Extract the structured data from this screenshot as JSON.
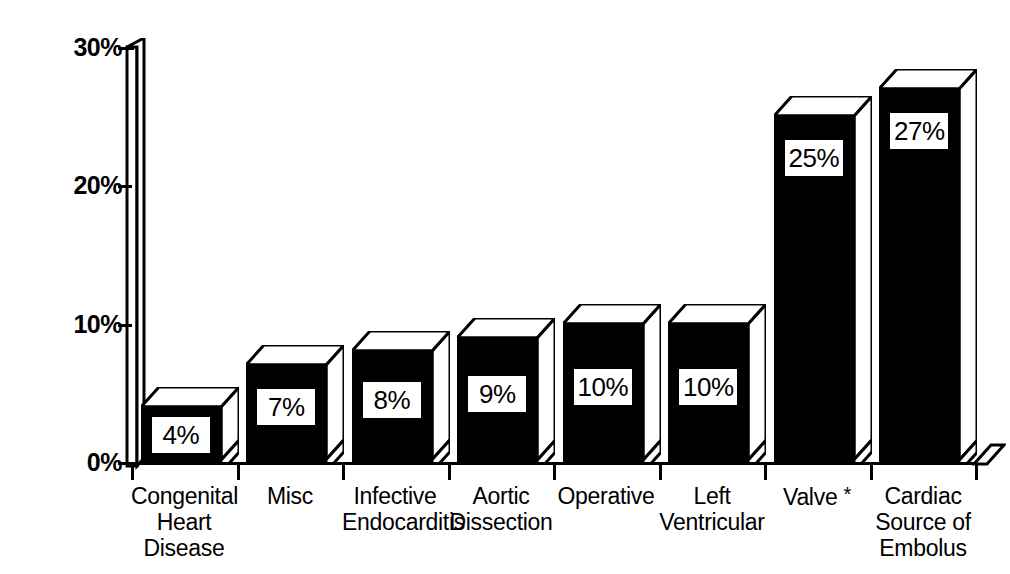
{
  "chart_data": {
    "type": "bar",
    "title": "",
    "subtitle": "",
    "xlabel": "",
    "ylabel": "",
    "categories": [
      "Congenital Heart Disease",
      "Misc",
      "Infective Endocarditis",
      "Aortic Dissection",
      "Operative",
      "Left Ventricular",
      "Valve *",
      "Cardiac Source of Embolus"
    ],
    "category_lines": [
      [
        "Congenital",
        "Heart",
        "Disease"
      ],
      [
        "Misc"
      ],
      [
        "Infective",
        "Endocarditis"
      ],
      [
        "Aortic",
        "Dissection"
      ],
      [
        "Operative"
      ],
      [
        "Left",
        "Ventricular"
      ],
      [
        "Valve *"
      ],
      [
        "Cardiac",
        "Source of",
        "Embolus"
      ]
    ],
    "values": [
      4,
      7,
      8,
      9,
      10,
      10,
      25,
      27
    ],
    "value_labels": [
      "4%",
      "7%",
      "8%",
      "9%",
      "10%",
      "10%",
      "25%",
      "27%"
    ],
    "ylim": [
      0,
      30
    ],
    "ytick_values": [
      0,
      10,
      20,
      30
    ],
    "ytick_labels": [
      "0%",
      "10%",
      "20%",
      "30%"
    ],
    "grid": false,
    "legend": null,
    "style": "3d-bar",
    "colors": {
      "bar_front": "#000000",
      "bar_top": "#ffffff",
      "bar_side": "#ffffff",
      "outline": "#000000",
      "label_box_bg": "#ffffff",
      "label_text": "#000000",
      "background": "#ffffff",
      "axis": "#000000"
    },
    "footnote": "*"
  }
}
